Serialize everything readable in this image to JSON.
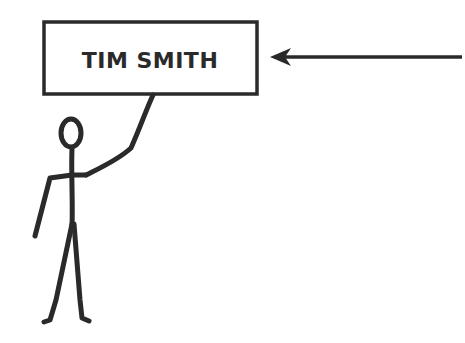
{
  "diagram": {
    "sign": {
      "label": "TIM SMITH"
    },
    "arrow": {
      "direction": "left",
      "points_to": "sign"
    },
    "figure": {
      "type": "stick-figure",
      "pose": "holding sign"
    },
    "colors": {
      "stroke": "#2a2a2a",
      "background": "#ffffff"
    }
  }
}
